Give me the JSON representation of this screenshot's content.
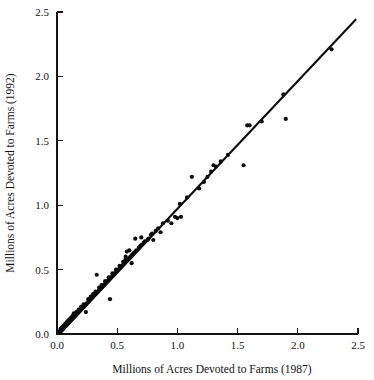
{
  "chart_data": {
    "type": "scatter",
    "title": "",
    "xlabel": "Millions of Acres Devoted to Farms (1987)",
    "ylabel": "Millions of Acres Devoted to Farms (1992)",
    "xlim": [
      0.0,
      2.5
    ],
    "ylim": [
      0.0,
      2.5
    ],
    "xticks": [
      0.0,
      0.5,
      1.0,
      1.5,
      2.0,
      2.5
    ],
    "yticks": [
      0.0,
      0.5,
      1.0,
      1.5,
      2.0,
      2.5
    ],
    "xtick_labels": [
      "0.0",
      "0.5",
      "1.0",
      "1.5",
      "2.0",
      "2.5"
    ],
    "ytick_labels": [
      "0.0",
      "0.5",
      "1.0",
      "1.5",
      "2.0",
      "2.5"
    ],
    "grid": false,
    "legend": "none",
    "marker": "filled-circle",
    "marker_color": "#0b0b0b",
    "marker_size_px": 3.2,
    "reference_line": {
      "label": "identity / fit line",
      "type": "line",
      "color": "#0d0d0d",
      "x": [
        0.02,
        2.48
      ],
      "y": [
        0.0,
        2.44
      ]
    },
    "series": [
      {
        "name": "States",
        "points": [
          [
            0.02,
            0.02
          ],
          [
            0.03,
            0.02
          ],
          [
            0.03,
            0.04
          ],
          [
            0.04,
            0.03
          ],
          [
            0.04,
            0.05
          ],
          [
            0.05,
            0.04
          ],
          [
            0.05,
            0.06
          ],
          [
            0.06,
            0.05
          ],
          [
            0.06,
            0.07
          ],
          [
            0.07,
            0.06
          ],
          [
            0.07,
            0.08
          ],
          [
            0.08,
            0.07
          ],
          [
            0.08,
            0.09
          ],
          [
            0.09,
            0.08
          ],
          [
            0.09,
            0.1
          ],
          [
            0.1,
            0.09
          ],
          [
            0.1,
            0.11
          ],
          [
            0.11,
            0.1
          ],
          [
            0.11,
            0.12
          ],
          [
            0.12,
            0.11
          ],
          [
            0.12,
            0.13
          ],
          [
            0.13,
            0.12
          ],
          [
            0.13,
            0.14
          ],
          [
            0.14,
            0.13
          ],
          [
            0.14,
            0.16
          ],
          [
            0.15,
            0.14
          ],
          [
            0.16,
            0.15
          ],
          [
            0.16,
            0.17
          ],
          [
            0.17,
            0.16
          ],
          [
            0.18,
            0.17
          ],
          [
            0.18,
            0.19
          ],
          [
            0.19,
            0.18
          ],
          [
            0.2,
            0.19
          ],
          [
            0.2,
            0.21
          ],
          [
            0.21,
            0.2
          ],
          [
            0.22,
            0.21
          ],
          [
            0.22,
            0.23
          ],
          [
            0.23,
            0.22
          ],
          [
            0.24,
            0.23
          ],
          [
            0.24,
            0.17
          ],
          [
            0.25,
            0.24
          ],
          [
            0.26,
            0.25
          ],
          [
            0.26,
            0.27
          ],
          [
            0.27,
            0.26
          ],
          [
            0.28,
            0.27
          ],
          [
            0.28,
            0.29
          ],
          [
            0.29,
            0.28
          ],
          [
            0.3,
            0.29
          ],
          [
            0.3,
            0.31
          ],
          [
            0.31,
            0.3
          ],
          [
            0.32,
            0.31
          ],
          [
            0.32,
            0.33
          ],
          [
            0.33,
            0.32
          ],
          [
            0.33,
            0.46
          ],
          [
            0.34,
            0.33
          ],
          [
            0.35,
            0.34
          ],
          [
            0.35,
            0.36
          ],
          [
            0.36,
            0.35
          ],
          [
            0.37,
            0.36
          ],
          [
            0.37,
            0.38
          ],
          [
            0.38,
            0.37
          ],
          [
            0.39,
            0.38
          ],
          [
            0.4,
            0.39
          ],
          [
            0.4,
            0.41
          ],
          [
            0.41,
            0.4
          ],
          [
            0.42,
            0.41
          ],
          [
            0.43,
            0.42
          ],
          [
            0.43,
            0.44
          ],
          [
            0.44,
            0.43
          ],
          [
            0.44,
            0.27
          ],
          [
            0.45,
            0.44
          ],
          [
            0.46,
            0.45
          ],
          [
            0.46,
            0.47
          ],
          [
            0.47,
            0.46
          ],
          [
            0.48,
            0.47
          ],
          [
            0.49,
            0.48
          ],
          [
            0.49,
            0.5
          ],
          [
            0.5,
            0.49
          ],
          [
            0.51,
            0.5
          ],
          [
            0.52,
            0.51
          ],
          [
            0.52,
            0.53
          ],
          [
            0.53,
            0.52
          ],
          [
            0.54,
            0.53
          ],
          [
            0.55,
            0.54
          ],
          [
            0.55,
            0.56
          ],
          [
            0.56,
            0.55
          ],
          [
            0.57,
            0.58
          ],
          [
            0.57,
            0.6
          ],
          [
            0.58,
            0.57
          ],
          [
            0.58,
            0.64
          ],
          [
            0.59,
            0.58
          ],
          [
            0.6,
            0.59
          ],
          [
            0.6,
            0.65
          ],
          [
            0.61,
            0.6
          ],
          [
            0.62,
            0.61
          ],
          [
            0.62,
            0.55
          ],
          [
            0.63,
            0.62
          ],
          [
            0.64,
            0.63
          ],
          [
            0.65,
            0.74
          ],
          [
            0.65,
            0.64
          ],
          [
            0.66,
            0.65
          ],
          [
            0.68,
            0.67
          ],
          [
            0.69,
            0.68
          ],
          [
            0.7,
            0.69
          ],
          [
            0.7,
            0.75
          ],
          [
            0.72,
            0.71
          ],
          [
            0.73,
            0.72
          ],
          [
            0.75,
            0.73
          ],
          [
            0.76,
            0.74
          ],
          [
            0.78,
            0.77
          ],
          [
            0.79,
            0.78
          ],
          [
            0.8,
            0.73
          ],
          [
            0.82,
            0.8
          ],
          [
            0.84,
            0.82
          ],
          [
            0.86,
            0.79
          ],
          [
            0.88,
            0.86
          ],
          [
            0.92,
            0.88
          ],
          [
            0.95,
            0.86
          ],
          [
            0.98,
            0.91
          ],
          [
            1.0,
            0.9
          ],
          [
            1.02,
            1.01
          ],
          [
            1.03,
            0.91
          ],
          [
            1.08,
            1.06
          ],
          [
            1.12,
            1.22
          ],
          [
            1.18,
            1.13
          ],
          [
            1.22,
            1.18
          ],
          [
            1.25,
            1.22
          ],
          [
            1.28,
            1.26
          ],
          [
            1.3,
            1.31
          ],
          [
            1.32,
            1.3
          ],
          [
            1.36,
            1.34
          ],
          [
            1.42,
            1.39
          ],
          [
            1.55,
            1.31
          ],
          [
            1.58,
            1.62
          ],
          [
            1.6,
            1.62
          ],
          [
            1.7,
            1.65
          ],
          [
            1.88,
            1.86
          ],
          [
            1.9,
            1.67
          ],
          [
            2.28,
            2.21
          ]
        ]
      }
    ]
  },
  "axes": {
    "x_title": "Millions of Acres Devoted to Farms (1987)",
    "y_title": "Millions of Acres Devoted to Farms (1992)"
  }
}
